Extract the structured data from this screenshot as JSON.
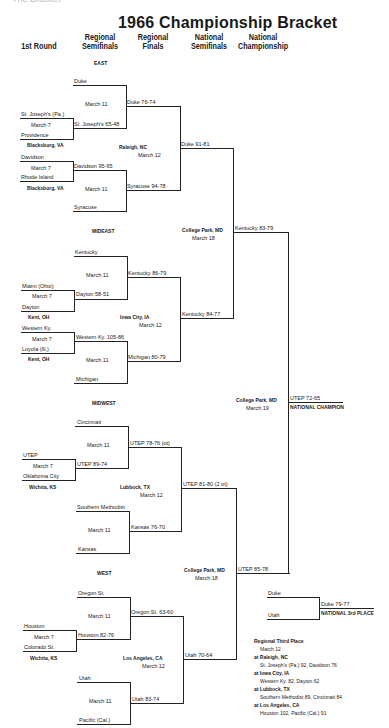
{
  "page_top_partial": "The Bracket",
  "title": "1966 Championship Bracket",
  "columns": [
    "1st Round",
    "Regional Semifinals",
    "Regional Finals",
    "National Semifinals",
    "National Championship"
  ],
  "columns_lines": {
    "c0": [
      "1st Round"
    ],
    "c1": [
      "Regional",
      "Semifinals"
    ],
    "c2": [
      "Regional",
      "Finals"
    ],
    "c3": [
      "National",
      "Semifinals"
    ],
    "c4": [
      "National",
      "Championship"
    ]
  },
  "regions": {
    "east": {
      "label": "EAST",
      "first_round": [
        {
          "top": "St. Joseph's (Pa.)",
          "bottom": "Providence",
          "date": "March 7",
          "site": "Blacksburg, VA"
        },
        {
          "top": "Davidson",
          "bottom": "Rhode Island",
          "date": "March 7",
          "site": "Blacksburg, VA"
        }
      ],
      "semis": [
        {
          "top": "Duke",
          "bottom": "St. Joseph's 65-48",
          "date": "March 11"
        },
        {
          "top": "Davidson 95-65",
          "bottom": "Syracuse",
          "date": "March 11"
        }
      ],
      "finals": {
        "top": "Duke 76-74",
        "bottom": "Syracuse 94-78",
        "site": "Raleigh, NC",
        "date": "March 12"
      },
      "winner": "Duke 91-81"
    },
    "mideast": {
      "label": "MIDEAST",
      "first_round": [
        {
          "top": "Miami (Ohio)",
          "bottom": "Dayton",
          "date": "March 7",
          "site": "Kent, OH"
        },
        {
          "top": "Western Ky.",
          "bottom": "Loyola (Ill.)",
          "date": "March 7",
          "site": "Kent, OH"
        }
      ],
      "semis": [
        {
          "top": "Kentucky",
          "bottom": "Dayton 58-51",
          "date": "March 11"
        },
        {
          "top": "Western Ky. 105-86",
          "bottom": "Michigan",
          "date": "March 11"
        }
      ],
      "finals": {
        "top": "Kentucky 86-79",
        "bottom": "Michigan 80-79",
        "site": "Iowa City, IA",
        "date": "March 12"
      },
      "winner": "Kentucky 84-77"
    },
    "midwest": {
      "label": "MIDWEST",
      "first_round": [
        {
          "top": "UTEP",
          "bottom": "Oklahoma City",
          "date": "March 7",
          "site": "Wichita, KS"
        }
      ],
      "semis": [
        {
          "top": "Cincinnati",
          "bottom": "UTEP 89-74",
          "date": "March 11"
        },
        {
          "top": "Southern Methodist",
          "bottom": "Kansas",
          "date": "March 11"
        }
      ],
      "finals": {
        "top": "UTEP 78-76 (ot)",
        "bottom": "Kansas 76-70",
        "site": "Lubbock, TX",
        "date": "March 12"
      },
      "winner": "UTEP 81-80 (2 ot)"
    },
    "west": {
      "label": "WEST",
      "first_round": [
        {
          "top": "Houston",
          "bottom": "Colorado St.",
          "date": "March 7",
          "site": "Wichita, KS"
        }
      ],
      "semis": [
        {
          "top": "Oregon St.",
          "bottom": "Houston 82-76",
          "date": "March 11"
        },
        {
          "top": "Utah",
          "bottom": "Pacific (Cal.)",
          "date": "March 11"
        }
      ],
      "finals": {
        "top": "Oregon St. 63-60",
        "bottom": "Utah 83-74",
        "site": "Los Angeles, CA",
        "date": "March 12"
      },
      "winner": "Utah 70-64"
    }
  },
  "national_semis": {
    "top": {
      "site": "College Park, MD",
      "date": "March 18",
      "winner": "Kentucky 83-79"
    },
    "bottom": {
      "site": "College Park, MD",
      "date": "March 18",
      "winner": "UTEP 85-78"
    }
  },
  "championship": {
    "site": "College Park, MD",
    "date": "March 19",
    "result": "UTEP 72-65",
    "label": "NATIONAL CHAMPION"
  },
  "third_place": {
    "top": "Duke",
    "bottom": "Utah",
    "result": "Duke 79-77",
    "label": "NATIONAL 3rd PLACE"
  },
  "regional_third_place": {
    "heading": "Regional Third Place",
    "date": "March 12",
    "games": [
      {
        "site": "at Raleigh, NC",
        "result": "St. Joseph's (Pa.) 92, Davidson 76"
      },
      {
        "site": "at Iowa City, IA",
        "result": "Western Ky. 82, Dayton 62"
      },
      {
        "site": "at Lubbock, TX",
        "result": "Southern Methodist 89, Cincinnati 84"
      },
      {
        "site": "at Los Angeles, CA",
        "result": "Houston 102, Pacific (Cal.) 91"
      }
    ]
  }
}
